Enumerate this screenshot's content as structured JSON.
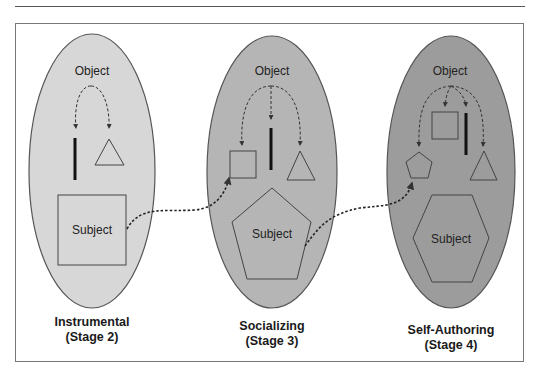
{
  "diagram": {
    "colors": {
      "stage2_fill": "#d7d7d7",
      "stage3_fill": "#b5b5b5",
      "stage4_fill": "#9c9c9c",
      "stroke": "#555555",
      "arrow": "#333333"
    },
    "stages": [
      {
        "id": "stage2",
        "object_label": "Object",
        "subject_label": "Subject",
        "subject_shape": "square",
        "object_shapes": [
          "line",
          "triangle"
        ],
        "title": "Instrumental",
        "subtitle": "(Stage 2)"
      },
      {
        "id": "stage3",
        "object_label": "Object",
        "subject_label": "Subject",
        "subject_shape": "pentagon",
        "object_shapes": [
          "square",
          "line",
          "triangle"
        ],
        "title": "Socializing",
        "subtitle": "(Stage 3)"
      },
      {
        "id": "stage4",
        "object_label": "Object",
        "subject_label": "Subject",
        "subject_shape": "hexagon",
        "object_shapes": [
          "pentagon",
          "square",
          "line",
          "triangle"
        ],
        "title": "Self-Authoring",
        "subtitle": "(Stage 4)"
      }
    ],
    "transitions": [
      {
        "from": "stage2.subject",
        "to": "stage3.object.square"
      },
      {
        "from": "stage3.subject",
        "to": "stage4.object.pentagon"
      }
    ]
  }
}
